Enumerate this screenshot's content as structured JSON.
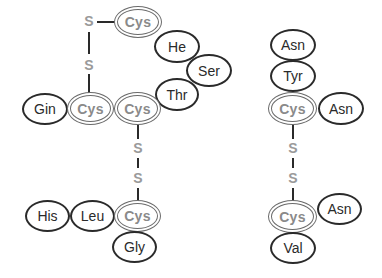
{
  "diagram": {
    "left_chain": {
      "nodes": [
        {
          "id": "cys_top",
          "label": "Cys",
          "type": "cysteine"
        },
        {
          "id": "ile",
          "label": "He",
          "type": "residue"
        },
        {
          "id": "ser",
          "label": "Ser",
          "type": "residue"
        },
        {
          "id": "thr",
          "label": "Thr",
          "type": "residue"
        },
        {
          "id": "gln",
          "label": "Gin",
          "type": "residue"
        },
        {
          "id": "cys_mid_left",
          "label": "Cys",
          "type": "cysteine"
        },
        {
          "id": "cys_mid_right",
          "label": "Cys",
          "type": "cysteine"
        },
        {
          "id": "his",
          "label": "His",
          "type": "residue"
        },
        {
          "id": "leu",
          "label": "Leu",
          "type": "residue"
        },
        {
          "id": "cys_bottom",
          "label": "Cys",
          "type": "cysteine"
        },
        {
          "id": "gly",
          "label": "Gly",
          "type": "residue"
        }
      ],
      "sulfur_labels": [
        "S",
        "S",
        "S",
        "S"
      ]
    },
    "right_chain": {
      "nodes": [
        {
          "id": "asn_top",
          "label": "Asn",
          "type": "residue"
        },
        {
          "id": "tyr",
          "label": "Tyr",
          "type": "residue"
        },
        {
          "id": "cys_upper",
          "label": "Cys",
          "type": "cysteine"
        },
        {
          "id": "asn_mid",
          "label": "Asn",
          "type": "residue"
        },
        {
          "id": "cys_lower",
          "label": "Cys",
          "type": "cysteine"
        },
        {
          "id": "asn_lower",
          "label": "Asn",
          "type": "residue"
        },
        {
          "id": "val",
          "label": "Val",
          "type": "residue"
        }
      ],
      "sulfur_labels": [
        "S",
        "S"
      ]
    },
    "colors": {
      "outline": "#2a2a2a",
      "cysteine_text": "#8a8a8a",
      "sulfur_text": "#9a9a9a",
      "background": "#ffffff"
    }
  }
}
